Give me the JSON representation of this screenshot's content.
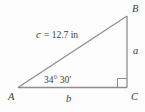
{
  "figure": {
    "type": "right-triangle-diagram",
    "vertex_labels": {
      "A": "A",
      "B": "B",
      "C": "C"
    },
    "side_labels": {
      "vertical": "a",
      "horizontal": "b"
    },
    "hypotenuse_label": {
      "variable": "c",
      "value": "= 12.7 in"
    },
    "angle_label": "34° 30′",
    "colors": {
      "line": "#8f8f8f",
      "text": "#3a3a3a",
      "background": "#fdfdfd"
    }
  }
}
